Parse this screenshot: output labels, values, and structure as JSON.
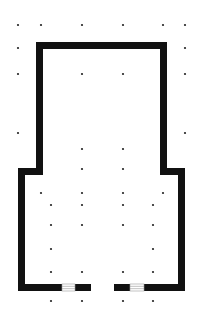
{
  "diagram": {
    "type": "floor-plan",
    "width": 199,
    "height": 324,
    "colors": {
      "background": "#ffffff",
      "wall": "#111111",
      "dot": "#222222",
      "window": "#ffffff",
      "window_line": "#999999"
    },
    "wall_thickness": 7,
    "outline": [
      [
        36,
        42
      ],
      [
        167,
        42
      ],
      [
        167,
        168
      ],
      [
        185,
        168
      ],
      [
        185,
        291
      ],
      [
        18,
        291
      ],
      [
        18,
        168
      ],
      [
        36,
        168
      ]
    ],
    "walls": [
      {
        "id": "top",
        "x": 36,
        "y": 42,
        "w": 131,
        "h": 7
      },
      {
        "id": "upper-left",
        "x": 36,
        "y": 42,
        "w": 7,
        "h": 133
      },
      {
        "id": "upper-right",
        "x": 160,
        "y": 42,
        "w": 7,
        "h": 133
      },
      {
        "id": "step-left",
        "x": 18,
        "y": 168,
        "w": 25,
        "h": 7
      },
      {
        "id": "step-right",
        "x": 160,
        "y": 168,
        "w": 25,
        "h": 7
      },
      {
        "id": "lower-left",
        "x": 18,
        "y": 168,
        "w": 7,
        "h": 123
      },
      {
        "id": "lower-right",
        "x": 178,
        "y": 168,
        "w": 7,
        "h": 123
      },
      {
        "id": "bottom-1",
        "x": 18,
        "y": 284,
        "w": 44,
        "h": 7
      },
      {
        "id": "bottom-2",
        "x": 75,
        "y": 284,
        "w": 16,
        "h": 7
      },
      {
        "id": "bottom-3",
        "x": 114,
        "y": 284,
        "w": 16,
        "h": 7
      },
      {
        "id": "bottom-4",
        "x": 144,
        "y": 284,
        "w": 41,
        "h": 7
      }
    ],
    "windows": [
      {
        "id": "window-left",
        "x": 62,
        "y": 284,
        "w": 13,
        "h": 7
      },
      {
        "id": "window-right",
        "x": 130,
        "y": 284,
        "w": 14,
        "h": 7
      }
    ],
    "door_gap": {
      "x": 91,
      "y": 284,
      "w": 23,
      "h": 7
    },
    "dots": [
      [
        18,
        25
      ],
      [
        41,
        25
      ],
      [
        82,
        25
      ],
      [
        123,
        25
      ],
      [
        163,
        25
      ],
      [
        185,
        25
      ],
      [
        18,
        48
      ],
      [
        185,
        48
      ],
      [
        18,
        74
      ],
      [
        82,
        74
      ],
      [
        123,
        74
      ],
      [
        185,
        74
      ],
      [
        18,
        133
      ],
      [
        185,
        133
      ],
      [
        82,
        149
      ],
      [
        123,
        149
      ],
      [
        82,
        169
      ],
      [
        123,
        169
      ],
      [
        41,
        193
      ],
      [
        82,
        193
      ],
      [
        123,
        193
      ],
      [
        163,
        193
      ],
      [
        51,
        205
      ],
      [
        82,
        205
      ],
      [
        123,
        205
      ],
      [
        153,
        205
      ],
      [
        51,
        225
      ],
      [
        82,
        225
      ],
      [
        123,
        225
      ],
      [
        153,
        225
      ],
      [
        51,
        249
      ],
      [
        153,
        249
      ],
      [
        51,
        272
      ],
      [
        82,
        272
      ],
      [
        123,
        272
      ],
      [
        153,
        272
      ],
      [
        51,
        301
      ],
      [
        82,
        301
      ],
      [
        123,
        301
      ],
      [
        153,
        301
      ]
    ],
    "dot_radius": 1.1
  }
}
